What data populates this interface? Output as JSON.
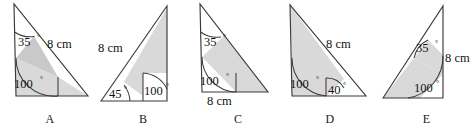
{
  "figure": {
    "caption_font_note": "",
    "shade_color": "#d9d9d9",
    "shade_color_dark": "#bdbdbd",
    "stroke_color": "#3a3a3a",
    "degree_symbol": "°",
    "items": [
      {
        "label": "A",
        "length_label": "8 cm",
        "angles": [
          "35",
          "100"
        ],
        "angle_top": "35",
        "angle_bottom": "100",
        "length_side": "hypotenuse"
      },
      {
        "label": "B",
        "length_label": "8 cm",
        "angles": [
          "45",
          "100"
        ],
        "angle_left": "45",
        "angle_interior": "100",
        "length_side": "left-slant"
      },
      {
        "label": "C",
        "length_label": "8 cm",
        "angles": [
          "35",
          "100"
        ],
        "angle_top": "35",
        "angle_bottom": "100",
        "length_side": "base"
      },
      {
        "label": "D",
        "length_label": "8 cm",
        "angles": [
          "100",
          "40"
        ],
        "angle_left": "100",
        "angle_interior": "40",
        "length_side": "hypotenuse"
      },
      {
        "label": "E",
        "length_label": "8 cm",
        "angles": [
          "35",
          "100"
        ],
        "angle_top": "35",
        "angle_bottom": "100",
        "length_side": "right-vertical"
      }
    ]
  }
}
